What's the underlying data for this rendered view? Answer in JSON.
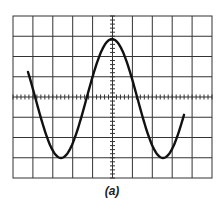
{
  "figure": {
    "caption": "(a)",
    "type": "oscilloscope sine waveform",
    "grid": {
      "major_divisions_x": 10,
      "major_divisions_y": 8,
      "minor_ticks_per_division": 5,
      "line_color": "#333333"
    },
    "trace": {
      "shape": "sine",
      "color": "#111111",
      "peak_division": 2.9,
      "trough_division": -3.0,
      "period_divisions": 5.2
    }
  }
}
